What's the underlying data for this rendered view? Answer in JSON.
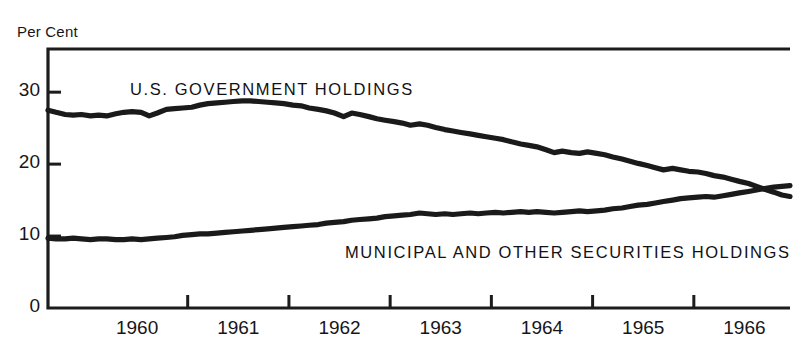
{
  "chart_data": {
    "type": "line",
    "title": "",
    "subtitle": "",
    "ylabel": "Per Cent",
    "xlabel": "",
    "ylim": [
      0,
      36
    ],
    "xlim": [
      1959.62,
      1966.95
    ],
    "yticks": [
      0,
      10,
      20,
      30
    ],
    "ytick_labels": [
      "0",
      "10",
      "20",
      "30"
    ],
    "xticks": [
      1960,
      1961,
      1962,
      1963,
      1964,
      1965,
      1966
    ],
    "xtick_labels": [
      "1960",
      "1961",
      "1962",
      "1963",
      "1964",
      "1965",
      "1966"
    ],
    "grid": false,
    "legend_position": "inline-annotations",
    "annotations": [
      {
        "text": "U.S. GOVERNMENT HOLDINGS",
        "series": "U.S. Government Holdings",
        "x": 1960.6,
        "y": 32.0
      },
      {
        "text": "MUNICIPAL AND OTHER SECURITIES HOLDINGS",
        "series": "Municipal and Other Securities Holdings",
        "x": 1962.8,
        "y": 10.8
      }
    ],
    "series": [
      {
        "name": "U.S. Government Holdings",
        "color": "#1a1a1a",
        "x": [
          1959.62,
          1959.7,
          1959.79,
          1959.87,
          1959.95,
          1960.04,
          1960.12,
          1960.2,
          1960.29,
          1960.37,
          1960.45,
          1960.54,
          1960.62,
          1960.7,
          1960.79,
          1960.87,
          1960.95,
          1961.04,
          1961.12,
          1961.2,
          1961.29,
          1961.37,
          1961.45,
          1961.54,
          1961.62,
          1961.7,
          1961.79,
          1961.87,
          1961.95,
          1962.04,
          1962.12,
          1962.2,
          1962.29,
          1962.37,
          1962.45,
          1962.54,
          1962.62,
          1962.7,
          1962.79,
          1962.87,
          1962.95,
          1963.04,
          1963.12,
          1963.2,
          1963.29,
          1963.37,
          1963.45,
          1963.54,
          1963.62,
          1963.7,
          1963.79,
          1963.87,
          1963.95,
          1964.04,
          1964.12,
          1964.2,
          1964.29,
          1964.37,
          1964.45,
          1964.54,
          1964.62,
          1964.7,
          1964.79,
          1964.87,
          1964.95,
          1965.04,
          1965.12,
          1965.2,
          1965.29,
          1965.37,
          1965.45,
          1965.54,
          1965.62,
          1965.7,
          1965.79,
          1965.87,
          1965.95,
          1966.04,
          1966.12,
          1966.2,
          1966.29,
          1966.37,
          1966.45,
          1966.54,
          1966.62,
          1966.7,
          1966.79,
          1966.87,
          1966.95
        ],
        "y": [
          27.5,
          27.2,
          26.9,
          26.8,
          26.9,
          26.7,
          26.8,
          26.7,
          27.0,
          27.2,
          27.3,
          27.2,
          26.7,
          27.1,
          27.6,
          27.7,
          27.8,
          27.9,
          28.2,
          28.4,
          28.5,
          28.6,
          28.7,
          28.8,
          28.8,
          28.7,
          28.6,
          28.5,
          28.4,
          28.2,
          28.1,
          27.8,
          27.6,
          27.4,
          27.1,
          26.6,
          27.1,
          26.9,
          26.6,
          26.3,
          26.1,
          25.9,
          25.7,
          25.4,
          25.6,
          25.4,
          25.1,
          24.8,
          24.6,
          24.4,
          24.2,
          24.0,
          23.8,
          23.6,
          23.4,
          23.1,
          22.8,
          22.6,
          22.4,
          22.0,
          21.6,
          21.8,
          21.6,
          21.5,
          21.7,
          21.5,
          21.3,
          21.0,
          20.7,
          20.4,
          20.1,
          19.8,
          19.5,
          19.2,
          19.4,
          19.2,
          19.0,
          18.9,
          18.7,
          18.4,
          18.2,
          17.9,
          17.6,
          17.3,
          16.9,
          16.5,
          16.1,
          15.7,
          15.5
        ]
      },
      {
        "name": "Municipal and Other Securities Holdings",
        "color": "#1a1a1a",
        "x": [
          1959.62,
          1959.7,
          1959.79,
          1959.87,
          1959.95,
          1960.04,
          1960.12,
          1960.2,
          1960.29,
          1960.37,
          1960.45,
          1960.54,
          1960.62,
          1960.7,
          1960.79,
          1960.87,
          1960.95,
          1961.04,
          1961.12,
          1961.2,
          1961.29,
          1961.37,
          1961.45,
          1961.54,
          1961.62,
          1961.7,
          1961.79,
          1961.87,
          1961.95,
          1962.04,
          1962.12,
          1962.2,
          1962.29,
          1962.37,
          1962.45,
          1962.54,
          1962.62,
          1962.7,
          1962.79,
          1962.87,
          1962.95,
          1963.04,
          1963.12,
          1963.2,
          1963.29,
          1963.37,
          1963.45,
          1963.54,
          1963.62,
          1963.7,
          1963.79,
          1963.87,
          1963.95,
          1964.04,
          1964.12,
          1964.2,
          1964.29,
          1964.37,
          1964.45,
          1964.54,
          1964.62,
          1964.7,
          1964.79,
          1964.87,
          1964.95,
          1965.04,
          1965.12,
          1965.2,
          1965.29,
          1965.37,
          1965.45,
          1965.54,
          1965.62,
          1965.7,
          1965.79,
          1965.87,
          1965.95,
          1966.04,
          1966.12,
          1966.2,
          1966.29,
          1966.37,
          1966.45,
          1966.54,
          1966.62,
          1966.7,
          1966.79,
          1966.87,
          1966.95
        ],
        "y": [
          9.7,
          9.6,
          9.6,
          9.7,
          9.6,
          9.5,
          9.6,
          9.6,
          9.5,
          9.5,
          9.6,
          9.5,
          9.6,
          9.7,
          9.8,
          9.9,
          10.1,
          10.2,
          10.3,
          10.3,
          10.4,
          10.5,
          10.6,
          10.7,
          10.8,
          10.9,
          11.0,
          11.1,
          11.2,
          11.3,
          11.4,
          11.5,
          11.6,
          11.8,
          11.9,
          12.0,
          12.2,
          12.3,
          12.4,
          12.5,
          12.7,
          12.8,
          12.9,
          13.0,
          13.2,
          13.1,
          13.0,
          13.1,
          13.0,
          13.1,
          13.2,
          13.1,
          13.2,
          13.3,
          13.2,
          13.3,
          13.4,
          13.3,
          13.4,
          13.3,
          13.2,
          13.3,
          13.4,
          13.5,
          13.4,
          13.5,
          13.6,
          13.8,
          13.9,
          14.1,
          14.3,
          14.4,
          14.6,
          14.8,
          15.0,
          15.2,
          15.3,
          15.4,
          15.5,
          15.4,
          15.6,
          15.8,
          16.0,
          16.2,
          16.4,
          16.6,
          16.8,
          16.9,
          17.0
        ]
      }
    ]
  },
  "axis": {
    "ylabel": "Per Cent"
  }
}
